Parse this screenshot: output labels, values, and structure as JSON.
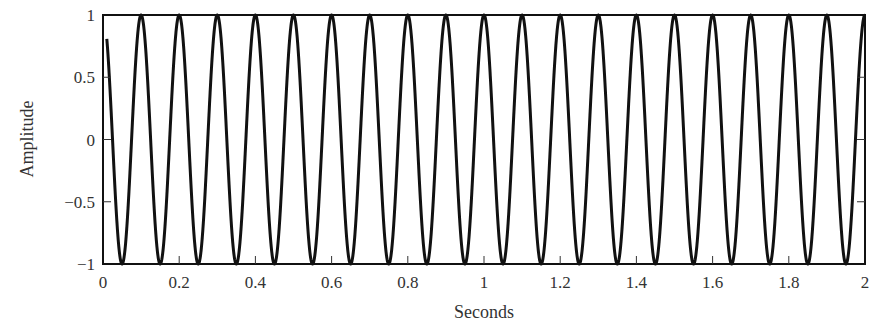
{
  "chart_data": {
    "type": "line",
    "title": "",
    "xlabel": "Seconds",
    "ylabel": "Amplitude",
    "xlim": [
      0,
      2
    ],
    "ylim": [
      -1,
      1
    ],
    "grid": false,
    "legend": null,
    "x_ticks": [
      0,
      0.2,
      0.4,
      0.6,
      0.8,
      1,
      1.2,
      1.4,
      1.6,
      1.8,
      2
    ],
    "x_tick_labels": [
      "0",
      "0.2",
      "0.4",
      "0.6",
      "0.8",
      "1",
      "1.2",
      "1.4",
      "1.6",
      "1.8",
      "2"
    ],
    "y_ticks": [
      1,
      0.5,
      0,
      -0.5,
      -1
    ],
    "y_tick_labels": [
      "1",
      "0.5",
      "0",
      "−0.5",
      "−1"
    ],
    "series": [
      {
        "name": "signal",
        "description": "cosine wave, amplitude 1, frequency 10 Hz, y = cos(2*pi*10*t)",
        "frequency_hz": 10,
        "amplitude": 1,
        "t_start": 0.01,
        "t_end": 2.0,
        "start_value": 0.81,
        "end_value": 1.0,
        "peaks_t": [
          0.1,
          0.2,
          0.3,
          0.4,
          0.5,
          0.6,
          0.7,
          0.8,
          0.9,
          1.0,
          1.1,
          1.2,
          1.3,
          1.4,
          1.5,
          1.6,
          1.7,
          1.8,
          1.9,
          2.0
        ],
        "troughs_t": [
          0.05,
          0.15,
          0.25,
          0.35,
          0.45,
          0.55,
          0.65,
          0.75,
          0.85,
          0.95,
          1.05,
          1.15,
          1.25,
          1.35,
          1.45,
          1.55,
          1.65,
          1.75,
          1.85,
          1.95
        ],
        "color": "#111111"
      }
    ]
  }
}
